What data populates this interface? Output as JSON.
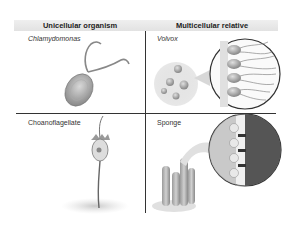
{
  "table": {
    "headers": [
      "Unicellular organism",
      "Multicellular relative"
    ],
    "rows": [
      {
        "unicellular": {
          "name": "Chlamydomonas",
          "italic": true
        },
        "multicellular": {
          "name": "Volvox",
          "italic": true
        }
      },
      {
        "unicellular": {
          "name": "Choanoflagellate",
          "italic": false
        },
        "multicellular": {
          "name": "Sponge",
          "italic": false
        }
      }
    ]
  },
  "colors": {
    "header_bg": "#e6e6e6",
    "divider": "#333333",
    "cell_gray": "#b0b0b0",
    "dark_tissue": "#555555"
  }
}
